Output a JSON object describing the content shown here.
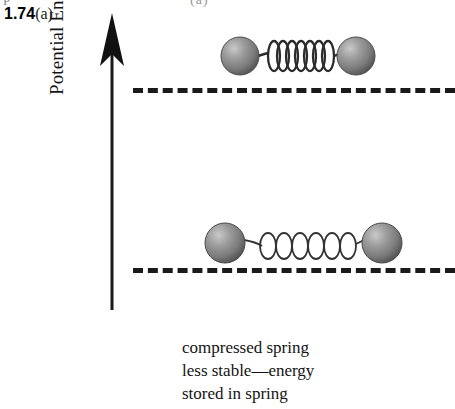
{
  "figure": {
    "label_number": "1.74",
    "label_suffix": "(a)",
    "top_crop_remnant_left": "P",
    "top_crop_remnant_right": "(a)"
  },
  "axis": {
    "label": "Potential Energy",
    "direction": "up",
    "arrow_icon": "up-arrow-icon",
    "color": "#1a1a1a"
  },
  "levels": [
    {
      "id": "upper",
      "name": "high-energy-level",
      "style": "dashed",
      "color": "#1a1a1a",
      "y": 88
    },
    {
      "id": "lower",
      "name": "low-energy-level",
      "style": "dashed",
      "color": "#1a1a1a",
      "y": 268
    }
  ],
  "assemblies": [
    {
      "id": "compressed",
      "name": "compressed-spring-assembly",
      "state": "compressed",
      "level": "upper",
      "coil_count": 7,
      "spring_thickness": "thick",
      "left_ball": {
        "cx": 240,
        "cy": 56,
        "r": 19
      },
      "right_ball": {
        "cx": 356,
        "cy": 56,
        "r": 19
      },
      "spring": {
        "x1": 258,
        "x2": 338,
        "cy": 56
      }
    },
    {
      "id": "relaxed",
      "name": "relaxed-spring-assembly",
      "state": "relaxed",
      "level": "lower",
      "coil_count": 7,
      "spring_thickness": "thin",
      "left_ball": {
        "cx": 225,
        "cy": 243,
        "r": 20
      },
      "right_ball": {
        "cx": 382,
        "cy": 243,
        "r": 20
      },
      "spring": {
        "x1": 246,
        "x2": 363,
        "cy": 243
      }
    }
  ],
  "ball": {
    "fill_light": "#b9b9b9",
    "fill_mid": "#8c8c8c",
    "fill_dark": "#5e5e5e",
    "edge": "#3d3d3d"
  },
  "caption": {
    "line1": "compressed spring",
    "line2": "less stable—energy",
    "line3": "stored in spring"
  }
}
